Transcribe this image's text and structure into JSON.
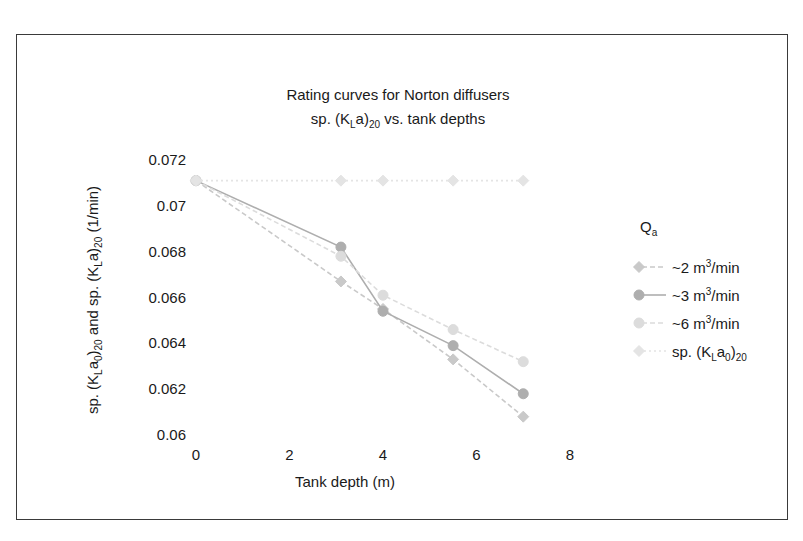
{
  "chart_data": {
    "type": "line",
    "title": "Rating curves for Norton diffusers",
    "subtitle": "sp. (KLa)20 vs. tank depths",
    "title_line1": "Rating curves for Norton diffusers",
    "title_line2_pre": "sp. (K",
    "title_line2_subL": "L",
    "title_line2_mid": "a)",
    "title_line2_sub20": "20",
    "title_line2_post": " vs. tank depths",
    "xlabel": "Tank depth (m)",
    "ylabel": "sp. (KLa0)20 and sp. (KLa)20 (1/min)",
    "ylabel_parts": {
      "p1": "sp. (K",
      "s1": "L",
      "p2": "a",
      "s2": "0",
      "p3": ")",
      "s3": "20",
      "p4": " and sp. (K",
      "s4": "L",
      "p5": "a)",
      "s5": "20",
      "p6": " (1/min)"
    },
    "xlim": [
      0,
      8
    ],
    "ylim": [
      0.06,
      0.072
    ],
    "xticks": [
      0,
      2,
      4,
      6,
      8
    ],
    "xticklabels": [
      "0",
      "2",
      "4",
      "6",
      "8"
    ],
    "yticks": [
      0.06,
      0.062,
      0.064,
      0.066,
      0.068,
      0.07,
      0.072
    ],
    "yticklabels": [
      "0.06",
      "0.062",
      "0.064",
      "0.066",
      "0.068",
      "0.07",
      "0.072"
    ],
    "grid": false,
    "legend_position": "right",
    "legend_title": "Qa",
    "legend_title_main": "Q",
    "legend_title_sub": "a",
    "series": [
      {
        "name": "~2 m3/min",
        "label_pre": "~2 m",
        "label_sup": "3",
        "label_post": "/min",
        "color": "#c9c9c9",
        "marker": "diamond",
        "linestyle": "dashed",
        "x": [
          0,
          3.1,
          4.0,
          5.5,
          7.0
        ],
        "y": [
          0.0711,
          0.0667,
          0.0655,
          0.0633,
          0.0608
        ]
      },
      {
        "name": "~3 m3/min",
        "label_pre": "~3 m",
        "label_sup": "3",
        "label_post": "/min",
        "color": "#aeaeae",
        "marker": "circle",
        "linestyle": "solid",
        "x": [
          0,
          3.1,
          4.0,
          5.5,
          7.0
        ],
        "y": [
          0.0711,
          0.0682,
          0.0654,
          0.0639,
          0.0618
        ]
      },
      {
        "name": "~6 m3/min",
        "label_pre": "~6 m",
        "label_sup": "3",
        "label_post": "/min",
        "color": "#dcdcdc",
        "marker": "circle",
        "linestyle": "dashed",
        "x": [
          0,
          3.1,
          4.0,
          5.5,
          7.0
        ],
        "y": [
          0.0711,
          0.0678,
          0.0661,
          0.0646,
          0.0632
        ]
      },
      {
        "name": "sp. (KLa0)20",
        "label_pre": "sp. (K",
        "label_subL": "L",
        "label_mid": "a",
        "label_sub0": "0",
        "label_close": ")",
        "label_sub20": "20",
        "color": "#e4e4e4",
        "marker": "diamond",
        "linestyle": "dotted",
        "x": [
          0,
          3.1,
          4.0,
          5.5,
          7.0
        ],
        "y": [
          0.0711,
          0.0711,
          0.0711,
          0.0711,
          0.0711
        ]
      }
    ]
  },
  "colors": {
    "frame_border": "#3a3a3a",
    "text": "#1a1a1a",
    "background": "#ffffff"
  }
}
